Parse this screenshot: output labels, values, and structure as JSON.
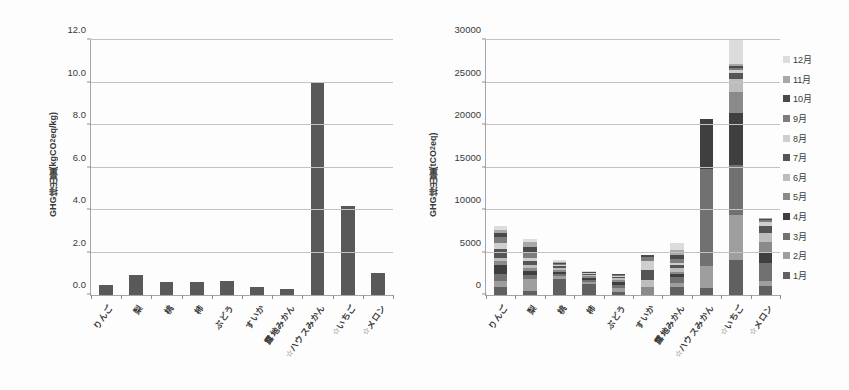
{
  "figure": {
    "background": "#fdfdfd",
    "bar_color": "#595959"
  },
  "chart_data": [
    {
      "id": "left",
      "type": "bar",
      "title": "",
      "xlabel": "",
      "ylabel": "GHG排出量(kgCO2eq/kg)",
      "ylabel_main": "GHG排出量(kgCO",
      "ylabel_sub": "2",
      "ylabel_tail": "eq/kg)",
      "ylim": [
        0,
        12
      ],
      "ytick_labels": [
        "0.0",
        "2.0",
        "4.0",
        "6.0",
        "8.0",
        "10.0",
        "12.0"
      ],
      "ytick_values": [
        0,
        2,
        4,
        6,
        8,
        10,
        12
      ],
      "grid": true,
      "legend": "none",
      "categories": [
        "りんご",
        "梨",
        "桃",
        "柿",
        "ぶどう",
        "すいか",
        "露地みかん",
        "☆ハウスみかん",
        "☆いちご",
        "☆メロン"
      ],
      "values": [
        0.45,
        0.95,
        0.62,
        0.62,
        0.67,
        0.4,
        0.3,
        10.0,
        4.2,
        1.05
      ],
      "series_color": "#595959"
    },
    {
      "id": "right",
      "type": "bar",
      "subtype": "stacked",
      "title": "",
      "xlabel": "",
      "ylabel": "GHG排出量(tCO2eq)",
      "ylabel_main": "GHG排出量(tCO",
      "ylabel_sub": "2",
      "ylabel_tail": "eq)",
      "ylim": [
        0,
        30000
      ],
      "ytick_labels": [
        "0",
        "5000",
        "10000",
        "15000",
        "20000",
        "25000",
        "30000"
      ],
      "ytick_values": [
        0,
        5000,
        10000,
        15000,
        20000,
        25000,
        30000
      ],
      "grid": true,
      "legend": "right",
      "legend_entries": [
        "12月",
        "11月",
        "10月",
        "9月",
        "8月",
        "7月",
        "6月",
        "5月",
        "4月",
        "3月",
        "2月",
        "1月"
      ],
      "legend_colors": [
        "#dcdcdc",
        "#a8a8a8",
        "#4a4a4a",
        "#7d7d7d",
        "#cfcfcf",
        "#555555",
        "#bdbdbd",
        "#8a8a8a",
        "#3f3f3f",
        "#717171",
        "#9e9e9e",
        "#606060"
      ],
      "categories": [
        "りんご",
        "梨",
        "桃",
        "柿",
        "ぶどう",
        "すいか",
        "露地みかん",
        "☆ハウスみかん",
        "☆いちご",
        "☆メロン"
      ],
      "series": [
        {
          "name": "1月",
          "color": "#606060",
          "values": [
            900,
            430,
            1900,
            1250,
            300,
            0,
            1000,
            850,
            4100,
            1100
          ]
        },
        {
          "name": "2月",
          "color": "#9e9e9e",
          "values": [
            700,
            1400,
            300,
            260,
            550,
            0,
            450,
            2600,
            5300,
            600
          ]
        },
        {
          "name": "3月",
          "color": "#717171",
          "values": [
            900,
            500,
            250,
            260,
            350,
            0,
            700,
            11400,
            5900,
            2100
          ]
        },
        {
          "name": "4月",
          "color": "#3f3f3f",
          "values": [
            1000,
            450,
            250,
            250,
            300,
            0,
            300,
            5900,
            6100,
            1150
          ]
        },
        {
          "name": "5月",
          "color": "#8a8a8a",
          "values": [
            500,
            400,
            300,
            250,
            250,
            900,
            320,
            0,
            2500,
            1250
          ]
        },
        {
          "name": "6月",
          "color": "#bdbdbd",
          "values": [
            400,
            300,
            180,
            120,
            200,
            900,
            400,
            0,
            1550,
            1100
          ]
        },
        {
          "name": "7月",
          "color": "#555555",
          "values": [
            1000,
            500,
            200,
            100,
            180,
            1200,
            320,
            0,
            700,
            850
          ]
        },
        {
          "name": "8月",
          "color": "#cfcfcf",
          "values": [
            700,
            400,
            150,
            100,
            130,
            1000,
            300,
            0,
            330,
            500
          ]
        },
        {
          "name": "9月",
          "color": "#7d7d7d",
          "values": [
            700,
            600,
            150,
            60,
            100,
            500,
            400,
            0,
            250,
            200
          ]
        },
        {
          "name": "10月",
          "color": "#4a4a4a",
          "values": [
            500,
            700,
            130,
            50,
            80,
            200,
            550,
            0,
            220,
            120
          ]
        },
        {
          "name": "11月",
          "color": "#a8a8a8",
          "values": [
            350,
            550,
            130,
            50,
            50,
            0,
            600,
            0,
            280,
            80
          ]
        },
        {
          "name": "12月",
          "color": "#dcdcdc",
          "values": [
            450,
            400,
            150,
            50,
            50,
            0,
            800,
            0,
            2900,
            50
          ]
        }
      ],
      "totals": [
        8100,
        6630,
        3890,
        2800,
        2540,
        4700,
        6140,
        20750,
        30130,
        9100
      ]
    }
  ]
}
